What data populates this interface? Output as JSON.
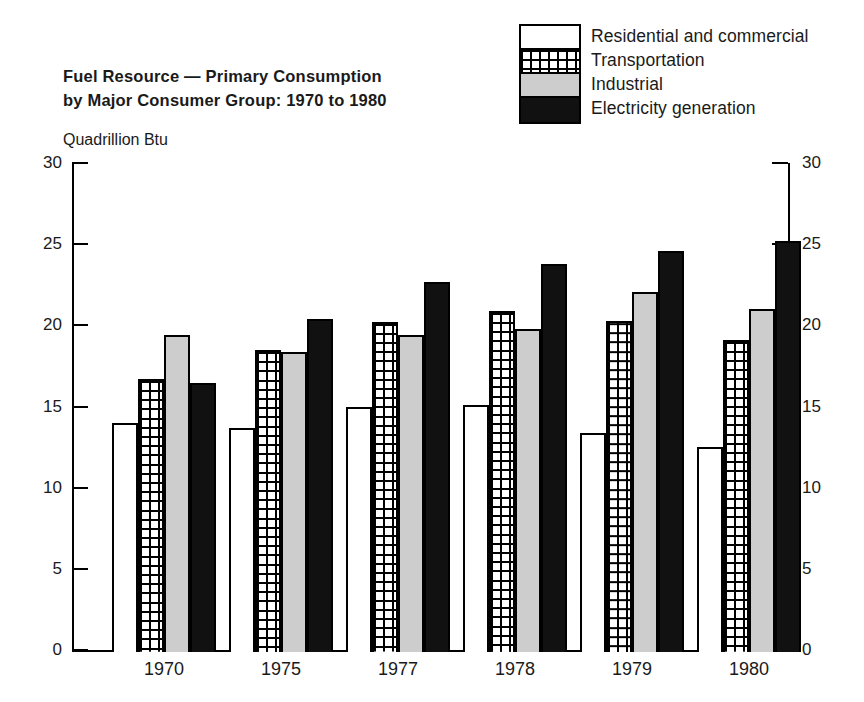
{
  "legend": {
    "items": [
      {
        "label": "Residential and commercial",
        "swatch": "white-swatch-icon",
        "color": "#ffffff"
      },
      {
        "label": "Transportation",
        "swatch": "grid-pattern-swatch-icon",
        "color": "#ffffff"
      },
      {
        "label": "Industrial",
        "swatch": "gray-swatch-icon",
        "color": "#cdcdcd"
      },
      {
        "label": "Electricity generation",
        "swatch": "black-swatch-icon",
        "color": "#111111"
      }
    ]
  },
  "title": {
    "line1": "Fuel Resource — Primary Consumption",
    "line2": "by Major Consumer Group:  1970 to 1980"
  },
  "axis": {
    "unit_label": "Quadrillion Btu",
    "left_ticks": [
      "30",
      "25",
      "20",
      "15",
      "10",
      "5",
      "0"
    ],
    "right_ticks": [
      "30",
      "25",
      "20",
      "15",
      "10",
      "5",
      "0"
    ]
  },
  "chart_data": {
    "type": "bar",
    "title": "Fuel Resource — Primary Consumption by Major Consumer Group:  1970 to 1980",
    "xlabel": "",
    "ylabel": "Quadrillion Btu",
    "ylim": [
      0,
      30
    ],
    "ytick_step": 5,
    "grid": false,
    "legend_position": "top-right",
    "categories": [
      "1970",
      "1975",
      "1977",
      "1978",
      "1979",
      "1980"
    ],
    "series": [
      {
        "name": "Residential and commercial",
        "color": "#ffffff",
        "pattern": "solid-outline",
        "values": [
          14.1,
          13.8,
          15.1,
          15.2,
          13.5,
          12.6
        ]
      },
      {
        "name": "Transportation",
        "color": "#ffffff",
        "pattern": "grid",
        "values": [
          16.8,
          18.6,
          20.3,
          21.0,
          20.4,
          19.2
        ]
      },
      {
        "name": "Industrial",
        "color": "#cdcdcd",
        "pattern": "solid",
        "values": [
          19.5,
          18.5,
          19.5,
          19.9,
          22.2,
          21.1
        ]
      },
      {
        "name": "Electricity generation",
        "color": "#111111",
        "pattern": "solid",
        "values": [
          16.6,
          20.5,
          22.8,
          23.9,
          24.7,
          25.3
        ]
      }
    ]
  }
}
